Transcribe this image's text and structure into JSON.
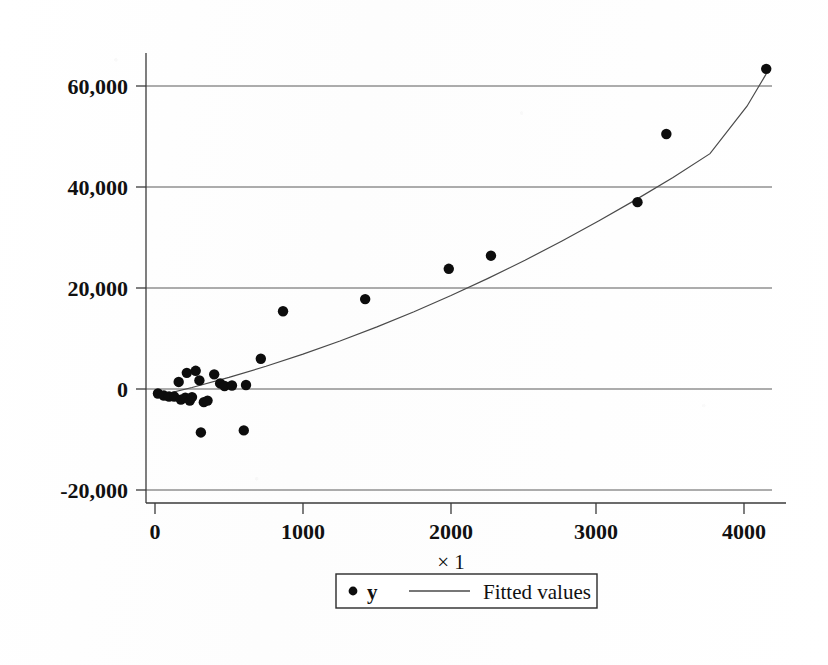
{
  "figure": {
    "background_color": "#ffffff",
    "ink_color": "#0d0d0d",
    "grid_color": "#5a5a5a",
    "width": 828,
    "height": 665
  },
  "chart_data": {
    "type": "scatter",
    "title": "",
    "subtitle": "",
    "xlabel": "× 1",
    "ylabel": "",
    "xlim": [
      -120,
      4170
    ],
    "ylim": [
      -22600,
      66900
    ],
    "xticks": [
      0,
      1000,
      2000,
      3000,
      4000
    ],
    "xticklabels": [
      "0",
      "1000",
      "2000",
      "3000",
      "4000"
    ],
    "yticks": [
      -20000,
      0,
      20000,
      40000,
      60000
    ],
    "yticklabels": [
      "-20,000",
      "0",
      "20,000",
      "40,000",
      "60,000"
    ],
    "grid": "horizontal",
    "legend_position": "below-center",
    "legend": [
      {
        "label": "y",
        "marker": "filled-circle",
        "kind": "scatter"
      },
      {
        "label": "Fitted values",
        "marker": "line",
        "kind": "line"
      }
    ],
    "series": [
      {
        "name": "y",
        "type": "scatter",
        "marker": "filled-circle",
        "color": "#0d0d0d",
        "points": [
          {
            "x": 20,
            "y": -900
          },
          {
            "x": 60,
            "y": -1300
          },
          {
            "x": 95,
            "y": -1500
          },
          {
            "x": 130,
            "y": -1500
          },
          {
            "x": 160,
            "y": 1400
          },
          {
            "x": 175,
            "y": -2100
          },
          {
            "x": 205,
            "y": -1700
          },
          {
            "x": 215,
            "y": 3200
          },
          {
            "x": 235,
            "y": -2300
          },
          {
            "x": 250,
            "y": -1600
          },
          {
            "x": 275,
            "y": 3600
          },
          {
            "x": 300,
            "y": 1700
          },
          {
            "x": 310,
            "y": -8600
          },
          {
            "x": 330,
            "y": -2600
          },
          {
            "x": 355,
            "y": -2300
          },
          {
            "x": 400,
            "y": 2900
          },
          {
            "x": 440,
            "y": 1100
          },
          {
            "x": 470,
            "y": 600
          },
          {
            "x": 520,
            "y": 700
          },
          {
            "x": 600,
            "y": -8200
          },
          {
            "x": 615,
            "y": 800
          },
          {
            "x": 715,
            "y": 6000
          },
          {
            "x": 865,
            "y": 15400
          },
          {
            "x": 1420,
            "y": 17800
          },
          {
            "x": 1985,
            "y": 23800
          },
          {
            "x": 2270,
            "y": 26400
          },
          {
            "x": 3260,
            "y": 37000
          },
          {
            "x": 3455,
            "y": 50500
          },
          {
            "x": 4130,
            "y": 63400
          }
        ]
      },
      {
        "name": "Fitted values",
        "type": "line",
        "color": "#4a4a4a",
        "description": "quadratic fit rising from about -1,500 at x=0 to about 62,000 at x=4130",
        "points": [
          {
            "x": 0,
            "y": -1500
          },
          {
            "x": 250,
            "y": 300
          },
          {
            "x": 500,
            "y": 2300
          },
          {
            "x": 750,
            "y": 4500
          },
          {
            "x": 1000,
            "y": 6900
          },
          {
            "x": 1250,
            "y": 9500
          },
          {
            "x": 1500,
            "y": 12300
          },
          {
            "x": 1750,
            "y": 15300
          },
          {
            "x": 2000,
            "y": 18500
          },
          {
            "x": 2250,
            "y": 21900
          },
          {
            "x": 2500,
            "y": 25500
          },
          {
            "x": 2750,
            "y": 29300
          },
          {
            "x": 3000,
            "y": 33300
          },
          {
            "x": 3250,
            "y": 37500
          },
          {
            "x": 3500,
            "y": 41900
          },
          {
            "x": 3750,
            "y": 46600
          },
          {
            "x": 4000,
            "y": 56000
          },
          {
            "x": 4130,
            "y": 62400
          }
        ]
      }
    ]
  }
}
